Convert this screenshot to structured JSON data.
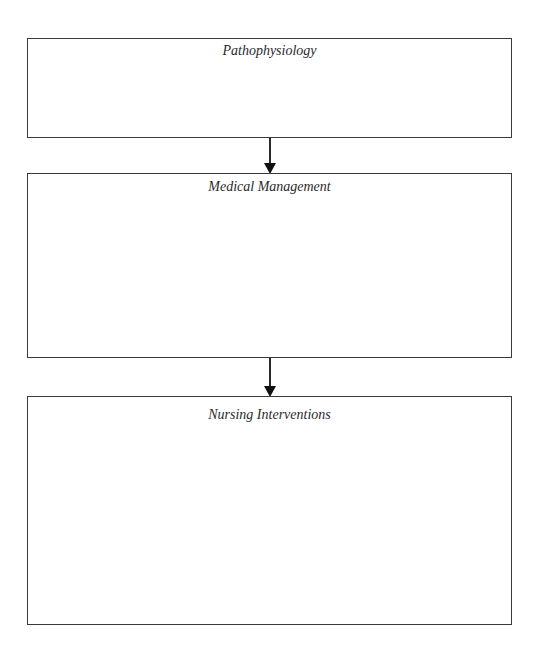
{
  "diagram": {
    "type": "flowchart",
    "direction": "top-to-bottom",
    "boxes": [
      {
        "id": "pathophysiology",
        "title": "Pathophysiology",
        "content": ""
      },
      {
        "id": "medical-management",
        "title": "Medical Management",
        "content": ""
      },
      {
        "id": "nursing-interventions",
        "title": "Nursing Interventions",
        "content": ""
      }
    ],
    "connectors": [
      {
        "from": "pathophysiology",
        "to": "medical-management",
        "style": "solid-arrow"
      },
      {
        "from": "medical-management",
        "to": "nursing-interventions",
        "style": "solid-arrow"
      }
    ],
    "colors": {
      "border": "#3a3a3a",
      "text": "#2a2a2a",
      "arrow": "#111111",
      "background": "#ffffff"
    }
  }
}
